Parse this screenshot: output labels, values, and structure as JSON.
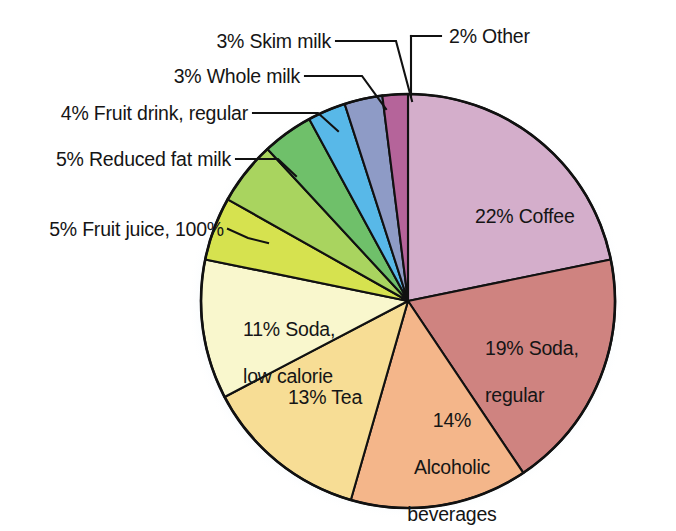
{
  "chart_data": {
    "type": "pie",
    "title": "",
    "subtitle": "",
    "xlabel": "",
    "ylabel": "",
    "legend_position": "none",
    "grid": false,
    "units": "percent",
    "total": 100,
    "start_angle_deg": 0,
    "direction": "clockwise",
    "categories": [
      "Coffee",
      "Soda, regular",
      "Alcoholic beverages",
      "Tea",
      "Soda, low calorie",
      "Fruit juice, 100%",
      "Reduced fat milk",
      "Fruit drink, regular",
      "Whole milk",
      "Skim milk",
      "Other"
    ],
    "values": [
      22,
      19,
      14,
      13,
      11,
      5,
      5,
      4,
      3,
      3,
      2
    ],
    "colors": [
      "#d4aecb",
      "#cf8380",
      "#f4b68a",
      "#f7dd95",
      "#f9f7cd",
      "#d6e24f",
      "#a9d45f",
      "#6fc06a",
      "#58b8e8",
      "#8e9bc6",
      "#b5649a"
    ],
    "slices": [
      {
        "id": "coffee",
        "label": "22% Coffee",
        "percent": 22,
        "name": "Coffee",
        "color": "#d4aecb",
        "label_placement": "inside"
      },
      {
        "id": "soda-regular",
        "label": "19% Soda,\nregular",
        "percent": 19,
        "name": "Soda, regular",
        "color": "#cf8380",
        "label_placement": "inside"
      },
      {
        "id": "alcoholic-beverages",
        "label": "14%\nAlcoholic\nbeverages",
        "percent": 14,
        "name": "Alcoholic beverages",
        "color": "#f4b68a",
        "label_placement": "inside"
      },
      {
        "id": "tea",
        "label": "13% Tea",
        "percent": 13,
        "name": "Tea",
        "color": "#f7dd95",
        "label_placement": "inside"
      },
      {
        "id": "soda-low-calorie",
        "label": "11% Soda,\nlow calorie",
        "percent": 11,
        "name": "Soda, low calorie",
        "color": "#f9f7cd",
        "label_placement": "inside"
      },
      {
        "id": "fruit-juice",
        "label": "5% Fruit juice, 100%",
        "percent": 5,
        "name": "Fruit juice, 100%",
        "color": "#d6e24f",
        "label_placement": "callout-left"
      },
      {
        "id": "reduced-fat-milk",
        "label": "5% Reduced fat milk",
        "percent": 5,
        "name": "Reduced fat milk",
        "color": "#a9d45f",
        "label_placement": "callout-left"
      },
      {
        "id": "fruit-drink-regular",
        "label": "4% Fruit drink, regular",
        "percent": 4,
        "name": "Fruit drink, regular",
        "color": "#6fc06a",
        "label_placement": "callout-left"
      },
      {
        "id": "whole-milk",
        "label": "3% Whole milk",
        "percent": 3,
        "name": "Whole milk",
        "color": "#58b8e8",
        "label_placement": "callout-left"
      },
      {
        "id": "skim-milk",
        "label": "3% Skim milk",
        "percent": 3,
        "name": "Skim milk",
        "color": "#8e9bc6",
        "label_placement": "callout-left"
      },
      {
        "id": "other",
        "label": "2% Other",
        "percent": 2,
        "name": "Other",
        "color": "#b5649a",
        "label_placement": "callout-right"
      }
    ]
  },
  "labels": {
    "skim_milk": "3% Skim milk",
    "whole_milk": "3% Whole milk",
    "fruit_drink_regular": "4% Fruit drink, regular",
    "reduced_fat_milk": "5% Reduced fat milk",
    "fruit_juice_100": "5% Fruit juice, 100%",
    "other": "2% Other",
    "coffee": "22% Coffee",
    "soda_regular_line1": "19% Soda,",
    "soda_regular_line2": "regular",
    "alcoholic_line1": "14%",
    "alcoholic_line2": "Alcoholic",
    "alcoholic_line3": "beverages",
    "tea": "13% Tea",
    "soda_low_calorie_line1": "11% Soda,",
    "soda_low_calorie_line2": "low calorie"
  },
  "style": {
    "outline_color": "#111111",
    "text_color": "#151515",
    "background": "#ffffff",
    "halo_color": "#e2edf5"
  }
}
